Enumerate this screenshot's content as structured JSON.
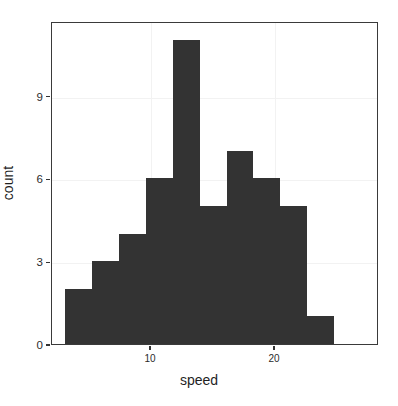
{
  "chart_data": {
    "type": "bar",
    "chart_subtype": "histogram",
    "title": "",
    "subtitle": "",
    "xlabel": "speed",
    "ylabel": "count",
    "grid": true,
    "legend": false,
    "legend_position": "none",
    "bar_color": "#333333",
    "panel_background": "#ffffff",
    "grid_color": "#f2f2f2",
    "axis_color": "#3a3a3a",
    "xlim": [
      2.0,
      28.4
    ],
    "ylim": [
      0,
      11.7
    ],
    "xticks": [
      10,
      20
    ],
    "xtick_labels": [
      "10",
      "20"
    ],
    "yticks": [
      0,
      3,
      6,
      9
    ],
    "ytick_labels": [
      "0",
      "3",
      "6",
      "9"
    ],
    "binwidth": 2.174,
    "bins": [
      {
        "x0": 3.04,
        "x1": 5.22,
        "center": 4.13,
        "count": 2
      },
      {
        "x0": 5.22,
        "x1": 7.39,
        "center": 6.3,
        "count": 3
      },
      {
        "x0": 7.39,
        "x1": 9.57,
        "center": 8.48,
        "count": 4
      },
      {
        "x0": 9.57,
        "x1": 11.74,
        "center": 10.65,
        "count": 6
      },
      {
        "x0": 11.74,
        "x1": 13.91,
        "center": 12.83,
        "count": 11
      },
      {
        "x0": 13.91,
        "x1": 16.09,
        "center": 15.0,
        "count": 5
      },
      {
        "x0": 16.09,
        "x1": 18.26,
        "center": 17.17,
        "count": 7
      },
      {
        "x0": 18.26,
        "x1": 20.43,
        "center": 19.35,
        "count": 6
      },
      {
        "x0": 20.43,
        "x1": 22.61,
        "center": 21.52,
        "count": 5
      },
      {
        "x0": 22.61,
        "x1": 24.78,
        "center": 23.7,
        "count": 1
      }
    ],
    "categories": [
      "4.13",
      "6.30",
      "8.48",
      "10.65",
      "12.83",
      "15.00",
      "17.17",
      "19.35",
      "21.52",
      "23.70"
    ],
    "values": [
      2,
      3,
      4,
      6,
      11,
      5,
      7,
      6,
      5,
      1
    ]
  }
}
